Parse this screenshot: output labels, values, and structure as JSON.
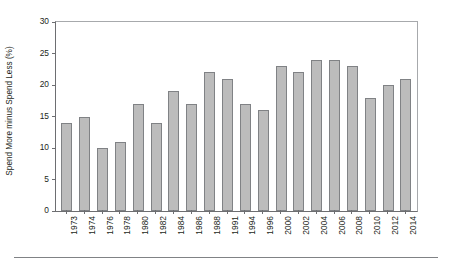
{
  "chart_data": {
    "type": "bar",
    "title": "",
    "subtitle": "",
    "xlabel": "",
    "ylabel": "Spend More minus Spend Less (%)",
    "categories": [
      "1973",
      "1974",
      "1976",
      "1978",
      "1980",
      "1982",
      "1984",
      "1986",
      "1988",
      "1991",
      "1994",
      "1996",
      "2000",
      "2002",
      "2004",
      "2006",
      "2008",
      "2010",
      "2012",
      "2014"
    ],
    "values": [
      14,
      15,
      10,
      11,
      17,
      14,
      19,
      17,
      22,
      21,
      17,
      16,
      23,
      22,
      24,
      24,
      23,
      18,
      20,
      21
    ],
    "series": [
      {
        "name": "Spend More minus Spend Less",
        "values": [
          14,
          15,
          10,
          11,
          17,
          14,
          19,
          17,
          22,
          21,
          17,
          16,
          23,
          22,
          24,
          24,
          23,
          18,
          20,
          21
        ]
      }
    ],
    "ylim": [
      0,
      30
    ],
    "yticks": [
      0,
      5,
      10,
      15,
      20,
      25,
      30
    ],
    "ytick_labels": [
      "0",
      "5",
      "10",
      "15",
      "20",
      "25",
      "30"
    ],
    "grid": false,
    "legend": "none",
    "bar_color": "#bcbcbc",
    "bar_border_color": "#808285",
    "axis_color": "#6d6e71",
    "frame_color": "#a7a9ac",
    "text_color": "#231f20"
  }
}
